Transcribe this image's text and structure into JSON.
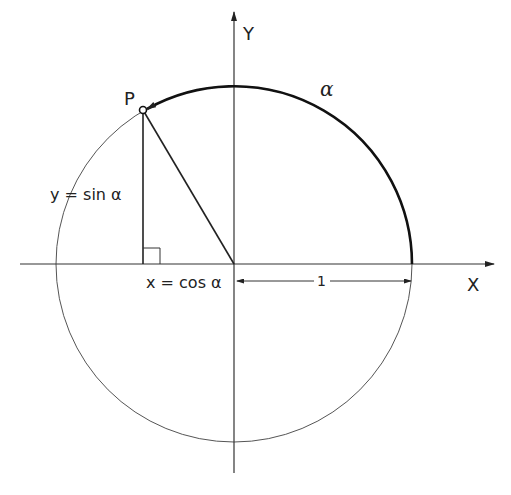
{
  "diagram": {
    "type": "unit-circle-trigonometry",
    "labels": {
      "y_axis": "Y",
      "x_axis": "X",
      "point": "P",
      "angle": "α",
      "sine": "y = sin α",
      "cosine": "x = cos α",
      "radius": "1"
    },
    "geometry": {
      "center": [
        234,
        264
      ],
      "radius": 177,
      "point_P": [
        143,
        110
      ],
      "x_axis": {
        "from": [
          20,
          264
        ],
        "to": [
          492,
          264
        ]
      },
      "y_axis": {
        "from": [
          234,
          473
        ],
        "to": [
          234,
          12
        ]
      }
    },
    "colors": {
      "ink": "#222222",
      "circle": "#555555",
      "background": "#ffffff"
    }
  }
}
